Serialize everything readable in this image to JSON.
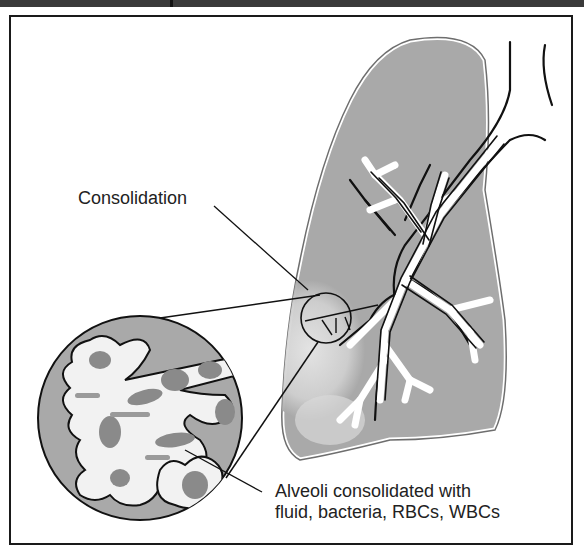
{
  "figure": {
    "type": "medical illustration",
    "labels": {
      "consolidation": "Consolidation",
      "alveoli_line1": "Alveoli consolidated with",
      "alveoli_line2": "fluid, bacteria, RBCs, WBCs"
    },
    "colors": {
      "lung_fill": "#a9a9a9",
      "lung_outline": "#6e6e6e",
      "consolidation_patch": "#dcdcdc",
      "alveoli_fill": "#f2f2f2",
      "cells": "#8a8a8a",
      "outline": "#111111",
      "frame": "#1a1a1a"
    }
  }
}
